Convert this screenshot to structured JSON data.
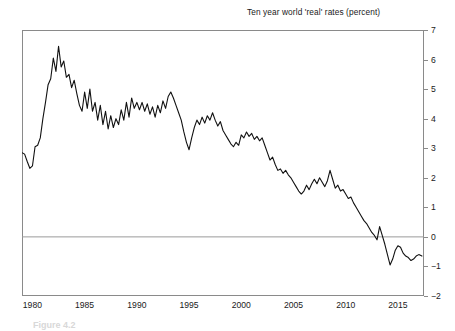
{
  "chart_data": {
    "type": "line",
    "title": "Ten year world 'real' rates (percent)",
    "xlabel": "",
    "ylabel": "",
    "xlim": [
      1979.0,
      2017.5
    ],
    "ylim": [
      -2,
      7
    ],
    "grid": false,
    "legend": "none",
    "zero_line": true,
    "line_color": "#111111",
    "frame_color": "#8a8a8a",
    "zero_line_color": "#9a9a9a",
    "xticks": [
      1980,
      1985,
      1990,
      1995,
      2000,
      2005,
      2010,
      2015
    ],
    "yticks": [
      -2,
      -1,
      0,
      1,
      2,
      3,
      4,
      5,
      6,
      7
    ],
    "series": [
      {
        "name": "Ten year world 'real' rates",
        "x": [
          1979.0,
          1979.25,
          1979.5,
          1979.75,
          1980.0,
          1980.25,
          1980.5,
          1980.75,
          1981.0,
          1981.25,
          1981.5,
          1981.75,
          1982.0,
          1982.25,
          1982.5,
          1982.75,
          1983.0,
          1983.25,
          1983.5,
          1983.75,
          1984.0,
          1984.25,
          1984.5,
          1984.75,
          1985.0,
          1985.25,
          1985.5,
          1985.75,
          1986.0,
          1986.25,
          1986.5,
          1986.75,
          1987.0,
          1987.25,
          1987.5,
          1987.75,
          1988.0,
          1988.25,
          1988.5,
          1988.75,
          1989.0,
          1989.25,
          1989.5,
          1989.75,
          1990.0,
          1990.25,
          1990.5,
          1990.75,
          1991.0,
          1991.25,
          1991.5,
          1991.75,
          1992.0,
          1992.25,
          1992.5,
          1992.75,
          1993.0,
          1993.25,
          1993.5,
          1993.75,
          1994.0,
          1994.25,
          1994.5,
          1994.75,
          1995.0,
          1995.25,
          1995.5,
          1995.75,
          1996.0,
          1996.25,
          1996.5,
          1996.75,
          1997.0,
          1997.25,
          1997.5,
          1997.75,
          1998.0,
          1998.25,
          1998.5,
          1998.75,
          1999.0,
          1999.25,
          1999.5,
          1999.75,
          2000.0,
          2000.25,
          2000.5,
          2000.75,
          2001.0,
          2001.25,
          2001.5,
          2001.75,
          2002.0,
          2002.25,
          2002.5,
          2002.75,
          2003.0,
          2003.25,
          2003.5,
          2003.75,
          2004.0,
          2004.25,
          2004.5,
          2004.75,
          2005.0,
          2005.25,
          2005.5,
          2005.75,
          2006.0,
          2006.25,
          2006.5,
          2006.75,
          2007.0,
          2007.25,
          2007.5,
          2007.75,
          2008.0,
          2008.25,
          2008.5,
          2008.75,
          2009.0,
          2009.25,
          2009.5,
          2009.75,
          2010.0,
          2010.25,
          2010.5,
          2010.75,
          2011.0,
          2011.25,
          2011.5,
          2011.75,
          2012.0,
          2012.25,
          2012.5,
          2012.75,
          2013.0,
          2013.25,
          2013.5,
          2013.75,
          2014.0,
          2014.25,
          2014.5,
          2014.75,
          2015.0,
          2015.25,
          2015.5,
          2015.75,
          2016.0,
          2016.25,
          2016.5,
          2016.75,
          2017.0,
          2017.3
        ],
        "values": [
          2.85,
          2.8,
          2.55,
          2.32,
          2.4,
          3.05,
          3.1,
          3.35,
          4.0,
          4.55,
          5.15,
          5.35,
          6.05,
          5.6,
          6.45,
          5.75,
          5.95,
          5.4,
          5.5,
          5.05,
          5.3,
          4.85,
          4.45,
          4.25,
          4.9,
          4.35,
          5.0,
          4.25,
          4.55,
          3.95,
          4.45,
          3.8,
          4.25,
          3.65,
          4.1,
          3.7,
          4.0,
          3.8,
          4.3,
          3.95,
          4.55,
          4.05,
          4.7,
          4.35,
          4.55,
          4.3,
          4.55,
          4.25,
          4.5,
          4.15,
          4.4,
          4.05,
          4.45,
          4.2,
          4.6,
          4.35,
          4.75,
          4.9,
          4.7,
          4.45,
          4.2,
          3.95,
          3.55,
          3.2,
          2.95,
          3.35,
          3.7,
          3.95,
          3.8,
          4.05,
          3.85,
          4.1,
          3.95,
          4.2,
          3.95,
          3.75,
          3.9,
          3.6,
          3.45,
          3.3,
          3.15,
          3.05,
          3.2,
          3.1,
          3.45,
          3.35,
          3.55,
          3.4,
          3.5,
          3.3,
          3.4,
          3.25,
          3.35,
          3.1,
          2.85,
          2.6,
          2.7,
          2.45,
          2.25,
          2.3,
          2.15,
          2.25,
          2.1,
          2.0,
          1.85,
          1.7,
          1.55,
          1.45,
          1.55,
          1.75,
          1.6,
          1.8,
          1.95,
          1.8,
          2.0,
          1.85,
          1.7,
          1.9,
          2.25,
          1.95,
          1.65,
          1.75,
          1.55,
          1.6,
          1.45,
          1.3,
          1.35,
          1.15,
          1.0,
          0.85,
          0.7,
          0.55,
          0.45,
          0.3,
          0.15,
          0.05,
          -0.1,
          0.35,
          0.05,
          -0.25,
          -0.6,
          -0.95,
          -0.75,
          -0.45,
          -0.3,
          -0.35,
          -0.55,
          -0.65,
          -0.7,
          -0.8,
          -0.75,
          -0.65,
          -0.6,
          -0.65
        ]
      }
    ]
  },
  "figure": {
    "caption": "Figure 4.2"
  }
}
